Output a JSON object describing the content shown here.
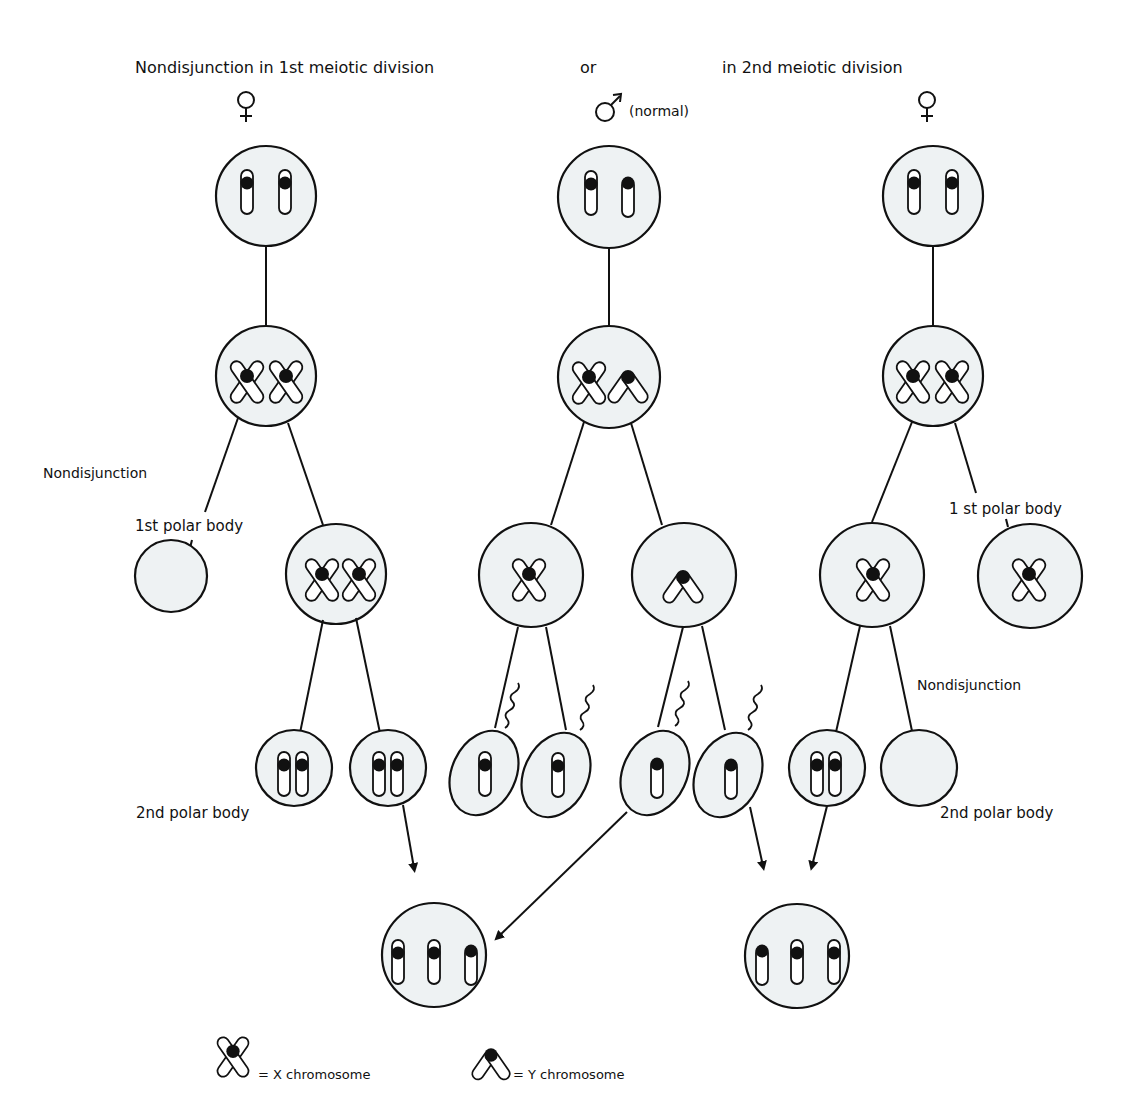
{
  "header": {
    "title_left": "Nondisjunction in  1st meiotic  division",
    "title_or": "or",
    "title_right": "in  2nd  meiotic  division",
    "female_symbol_left": "♀",
    "male_symbol": "♂",
    "male_note": "(normal)",
    "female_symbol_right": "♀"
  },
  "labels": {
    "nondisjunction_left": "Nondisjunction",
    "first_polar_body_left": "1st polar  body",
    "second_polar_body_left": "2nd  polar  body",
    "first_polar_body_right": "1 st  polar  body",
    "nondisjunction_right": "Nondisjunction",
    "second_polar_body_right": "2nd  polar  body"
  },
  "columns": [
    {
      "id": "female-meiosis-1",
      "sex": "female",
      "note": "Nondisjunction in 1st meiotic division"
    },
    {
      "id": "male-normal",
      "sex": "male",
      "note": "normal"
    },
    {
      "id": "female-meiosis-2",
      "sex": "female",
      "note": "Nondisjunction in 2nd meiotic division"
    }
  ],
  "outcomes": [
    {
      "id": "zygote-left",
      "chromosomes": "XXY",
      "from": [
        "female 1st-division nondisjunction egg (XX)",
        "male Y sperm"
      ]
    },
    {
      "id": "zygote-right",
      "chromosomes": "XXY",
      "from": [
        "male Y sperm",
        "female 2nd-division nondisjunction egg (XX)"
      ]
    }
  ],
  "legend": {
    "x_label": "=  X  chromosome",
    "y_label": "= Y  chromosome"
  },
  "colors": {
    "cell_fill": "#eef2f3",
    "stroke": "#111111",
    "background": "#ffffff"
  }
}
